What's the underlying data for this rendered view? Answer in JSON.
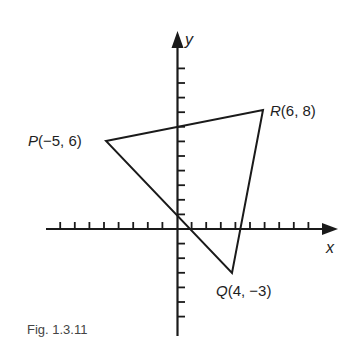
{
  "figure": {
    "caption": "Fig. 1.3.11",
    "axes": {
      "x_label": "x",
      "y_label": "y",
      "origin_px": [
        177,
        229
      ],
      "unit_px": 14.6,
      "x_ticks_left": 8,
      "x_ticks_right": 9,
      "y_ticks_up": 11,
      "y_ticks_down": 6
    },
    "points": [
      {
        "letter": "P",
        "coords": "(−5, 6)",
        "x": -5,
        "y": 6,
        "px": [
          106,
          141
        ]
      },
      {
        "letter": "R",
        "coords": "(6, 8)",
        "x": 6,
        "y": 8,
        "px": [
          263,
          110
        ]
      },
      {
        "letter": "Q",
        "coords": "(4, −3)",
        "x": 4,
        "y": -3,
        "px": [
          232,
          273
        ]
      }
    ],
    "shape": "triangle PQR",
    "colors": {
      "ink": "#1a1a1a",
      "background": "#ffffff",
      "caption": "#444444"
    }
  }
}
